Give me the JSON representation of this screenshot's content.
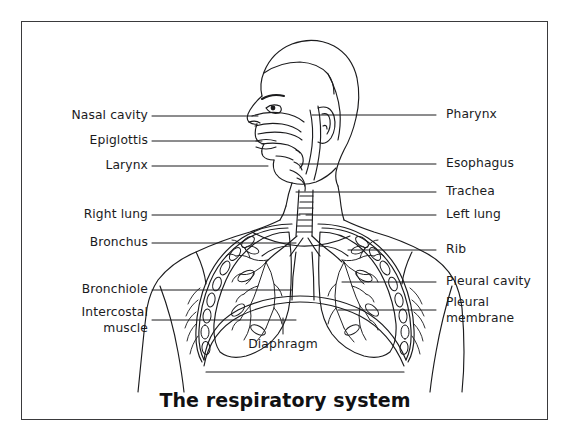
{
  "figure": {
    "title": "The respiratory system",
    "border_color": "#3a3a3c",
    "background_color": "#ffffff",
    "line_color": "#1b1b1d",
    "label_color": "#1b1b1d"
  },
  "labels": {
    "left": [
      {
        "text": "Nasal cavity",
        "x": 148,
        "y": 116,
        "leader_x2": 258
      },
      {
        "text": "Epiglottis",
        "x": 148,
        "y": 141,
        "leader_x2": 262
      },
      {
        "text": "Larynx",
        "x": 148,
        "y": 166,
        "leader_x2": 268
      },
      {
        "text": "Right lung",
        "x": 148,
        "y": 215,
        "leader_x2": 300
      },
      {
        "text": "Bronchus",
        "x": 148,
        "y": 243,
        "leader_x2": 296
      },
      {
        "text": "Bronchiole",
        "x": 148,
        "y": 290,
        "leader_x2": 292
      },
      {
        "text": "Intercostal\nmuscle",
        "x": 148,
        "y": 320,
        "leader_x2": 296
      }
    ],
    "right": [
      {
        "text": "Pharynx",
        "x": 446,
        "y": 115,
        "leader_x1": 312
      },
      {
        "text": "Esophagus",
        "x": 446,
        "y": 164,
        "leader_x1": 300
      },
      {
        "text": "Trachea",
        "x": 446,
        "y": 192,
        "leader_x1": 296
      },
      {
        "text": "Left lung",
        "x": 446,
        "y": 215,
        "leader_x1": 306
      },
      {
        "text": "Rib",
        "x": 446,
        "y": 250,
        "leader_x1": 348
      },
      {
        "text": "Pleural cavity",
        "x": 446,
        "y": 282,
        "leader_x1": 342
      },
      {
        "text": "Pleural\nmembrane",
        "x": 446,
        "y": 310,
        "leader_x1": 338
      }
    ],
    "center": [
      {
        "text": "Diaphragm",
        "x": 283,
        "y": 345,
        "leader_y1": 318,
        "leader_y2": 334
      }
    ]
  }
}
